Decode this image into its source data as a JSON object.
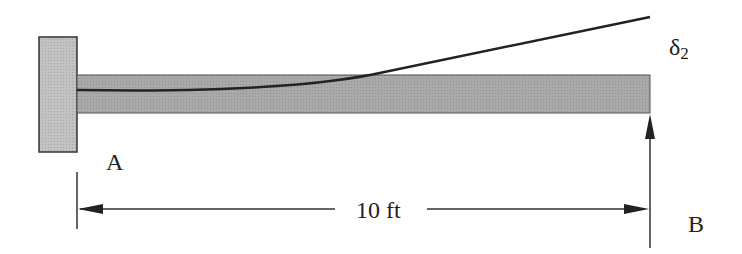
{
  "diagram": {
    "labels": {
      "support_a": "A",
      "support_b": "B",
      "span": "10 ft",
      "deflection": "δ",
      "deflection_subscript": "2"
    },
    "colors": {
      "beam_fill": "#a8a8a8",
      "wall_fill": "#bdbdbd",
      "stroke": "#2a2a2a",
      "background": "#ffffff"
    }
  }
}
